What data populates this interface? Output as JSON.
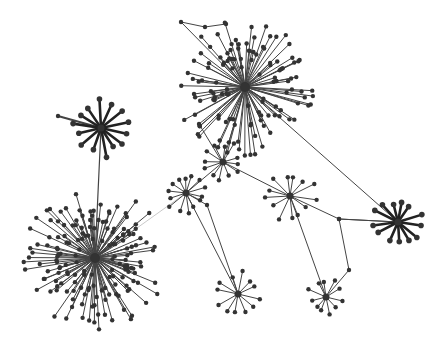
{
  "diagram": {
    "type": "network-graph",
    "width": 446,
    "height": 340,
    "background": "#ffffff",
    "node_color": "#333333",
    "edge_color": "#444444",
    "hubs": [
      {
        "id": "A",
        "x": 245,
        "y": 87,
        "leaves": 90,
        "rmin": 30,
        "rmax": 70,
        "bold": false,
        "seed": 3
      },
      {
        "id": "B",
        "x": 101,
        "y": 128,
        "leaves": 14,
        "rmin": 22,
        "rmax": 30,
        "bold": true,
        "seed": 5
      },
      {
        "id": "C",
        "x": 223,
        "y": 162,
        "leaves": 12,
        "rmin": 14,
        "rmax": 22,
        "bold": false,
        "seed": 7
      },
      {
        "id": "D",
        "x": 186,
        "y": 193,
        "leaves": 14,
        "rmin": 14,
        "rmax": 22,
        "bold": false,
        "seed": 11
      },
      {
        "id": "E",
        "x": 290,
        "y": 196,
        "leaves": 13,
        "rmin": 18,
        "rmax": 28,
        "bold": false,
        "seed": 13
      },
      {
        "id": "F",
        "x": 95,
        "y": 258,
        "leaves": 110,
        "rmin": 30,
        "rmax": 72,
        "bold": false,
        "seed": 17
      },
      {
        "id": "G",
        "x": 398,
        "y": 222,
        "leaves": 13,
        "rmin": 18,
        "rmax": 26,
        "bold": true,
        "seed": 19
      },
      {
        "id": "H",
        "x": 238,
        "y": 294,
        "leaves": 12,
        "rmin": 14,
        "rmax": 24,
        "bold": false,
        "seed": 23
      },
      {
        "id": "I",
        "x": 326,
        "y": 297,
        "leaves": 11,
        "rmin": 12,
        "rmax": 20,
        "bold": false,
        "seed": 29
      }
    ],
    "edges": [
      {
        "from": "B",
        "to": "F",
        "width": 1.2
      },
      {
        "from": "B",
        "pts": [
          [
            58,
            116
          ]
        ],
        "width": 2
      },
      {
        "from": "A",
        "to": "C",
        "width": 1
      },
      {
        "from": "A",
        "to": "G",
        "width": 1
      },
      {
        "from": "C",
        "to": "D",
        "width": 1
      },
      {
        "from": "C",
        "to": "E",
        "width": 1
      },
      {
        "from": "D",
        "to": "F",
        "width": 0.8,
        "light": true
      },
      {
        "from": "D",
        "to": "H",
        "width": 1
      },
      {
        "from": "E",
        "to": "I",
        "width": 1
      },
      {
        "from": "A",
        "pts": [
          [
            181,
            22
          ],
          [
            205,
            27
          ],
          [
            226,
            24
          ]
        ],
        "width": 1
      },
      {
        "from": "A",
        "pts": [
          [
            199,
            124
          ],
          [
            222,
            162
          ]
        ],
        "width": 1
      },
      {
        "from": "G",
        "pts": [
          [
            339,
            219
          ],
          [
            290,
            196
          ]
        ],
        "width": 1
      },
      {
        "from": "G",
        "pts": [
          [
            339,
            219
          ],
          [
            349,
            270
          ],
          [
            326,
            297
          ]
        ],
        "width": 1
      },
      {
        "from": "D",
        "pts": [
          [
            207,
            205
          ],
          [
            238,
            294
          ]
        ],
        "width": 1
      }
    ]
  }
}
